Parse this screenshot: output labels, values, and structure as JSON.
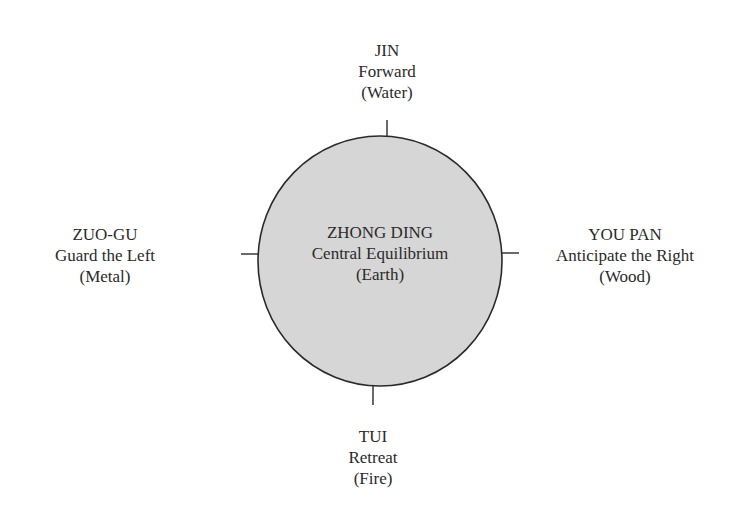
{
  "diagram": {
    "colors": {
      "circle_fill": "#d6d6d6",
      "circle_stroke": "#2a2a2a",
      "text": "#2a2a2a"
    },
    "center": {
      "name": "ZHONG DING",
      "meaning": "Central Equilibrium",
      "element": "(Earth)"
    },
    "top": {
      "name": "JIN",
      "meaning": "Forward",
      "element": "(Water)"
    },
    "bottom": {
      "name": "TUI",
      "meaning": "Retreat",
      "element": "(Fire)"
    },
    "left": {
      "name": "ZUO-GU",
      "meaning": "Guard the Left",
      "element": "(Metal)"
    },
    "right": {
      "name": "YOU PAN",
      "meaning": "Anticipate the Right",
      "element": "(Wood)"
    }
  }
}
